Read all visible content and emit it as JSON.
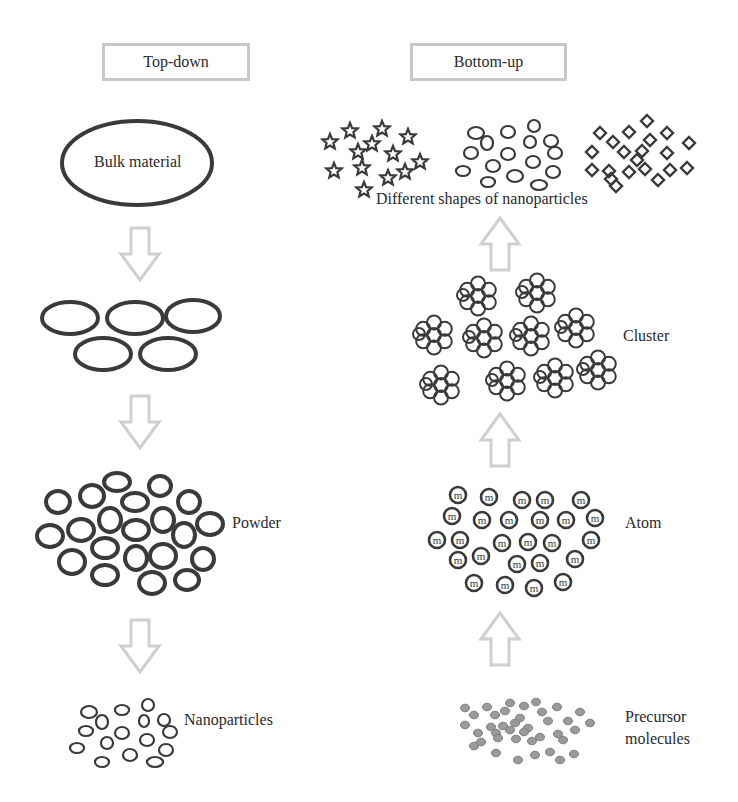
{
  "colors": {
    "outline": "#3a3a3a",
    "arrow": "#cfcfcf",
    "header_border": "#c8c8c8",
    "precursor_fill": "#9a9a9a",
    "precursor_stroke": "#7d7d7d",
    "text": "#2a2a2a"
  },
  "headers": {
    "top_down": "Top-down",
    "bottom_up": "Bottom-up"
  },
  "top_down": {
    "bulk_label": "Bulk material",
    "powder_label": "Powder",
    "nanoparticles_label": "Nanoparticles",
    "bulk": {
      "cx": 137,
      "cy": 163,
      "rx": 75,
      "ry": 42
    },
    "fragments": [
      {
        "cx": 70,
        "cy": 318,
        "rx": 28,
        "ry": 16
      },
      {
        "cx": 135,
        "cy": 318,
        "rx": 28,
        "ry": 16
      },
      {
        "cx": 193,
        "cy": 316,
        "rx": 27,
        "ry": 16
      },
      {
        "cx": 103,
        "cy": 354,
        "rx": 28,
        "ry": 16
      },
      {
        "cx": 168,
        "cy": 354,
        "rx": 28,
        "ry": 16
      }
    ],
    "powder": [
      {
        "cx": 58,
        "cy": 502,
        "rx": 12,
        "ry": 11
      },
      {
        "cx": 92,
        "cy": 496,
        "rx": 12,
        "ry": 11
      },
      {
        "cx": 117,
        "cy": 482,
        "rx": 13,
        "ry": 9
      },
      {
        "cx": 160,
        "cy": 486,
        "rx": 11,
        "ry": 10
      },
      {
        "cx": 135,
        "cy": 502,
        "rx": 13,
        "ry": 9
      },
      {
        "cx": 189,
        "cy": 502,
        "rx": 11,
        "ry": 11
      },
      {
        "cx": 50,
        "cy": 536,
        "rx": 13,
        "ry": 11
      },
      {
        "cx": 81,
        "cy": 530,
        "rx": 13,
        "ry": 11
      },
      {
        "cx": 110,
        "cy": 520,
        "rx": 11,
        "ry": 12
      },
      {
        "cx": 136,
        "cy": 530,
        "rx": 13,
        "ry": 10
      },
      {
        "cx": 163,
        "cy": 520,
        "rx": 11,
        "ry": 12
      },
      {
        "cx": 184,
        "cy": 535,
        "rx": 11,
        "ry": 12
      },
      {
        "cx": 210,
        "cy": 524,
        "rx": 13,
        "ry": 11
      },
      {
        "cx": 105,
        "cy": 548,
        "rx": 13,
        "ry": 10
      },
      {
        "cx": 72,
        "cy": 562,
        "rx": 13,
        "ry": 12
      },
      {
        "cx": 136,
        "cy": 558,
        "rx": 11,
        "ry": 12
      },
      {
        "cx": 163,
        "cy": 556,
        "rx": 13,
        "ry": 12
      },
      {
        "cx": 203,
        "cy": 559,
        "rx": 11,
        "ry": 11
      },
      {
        "cx": 105,
        "cy": 575,
        "rx": 13,
        "ry": 10
      },
      {
        "cx": 152,
        "cy": 583,
        "rx": 13,
        "ry": 11
      },
      {
        "cx": 187,
        "cy": 580,
        "rx": 12,
        "ry": 10
      }
    ],
    "nanoparticles": [
      {
        "cx": 89,
        "cy": 712,
        "rx": 8,
        "ry": 6
      },
      {
        "cx": 102,
        "cy": 722,
        "rx": 6,
        "ry": 7
      },
      {
        "cx": 122,
        "cy": 710,
        "rx": 7,
        "ry": 5
      },
      {
        "cx": 148,
        "cy": 705,
        "rx": 6,
        "ry": 6
      },
      {
        "cx": 144,
        "cy": 721,
        "rx": 5,
        "ry": 6
      },
      {
        "cx": 164,
        "cy": 720,
        "rx": 6,
        "ry": 6
      },
      {
        "cx": 86,
        "cy": 731,
        "rx": 7,
        "ry": 5
      },
      {
        "cx": 122,
        "cy": 733,
        "rx": 7,
        "ry": 6
      },
      {
        "cx": 170,
        "cy": 732,
        "rx": 7,
        "ry": 6
      },
      {
        "cx": 107,
        "cy": 743,
        "rx": 6,
        "ry": 6
      },
      {
        "cx": 147,
        "cy": 740,
        "rx": 7,
        "ry": 6
      },
      {
        "cx": 77,
        "cy": 748,
        "rx": 7,
        "ry": 5
      },
      {
        "cx": 130,
        "cy": 755,
        "rx": 7,
        "ry": 6
      },
      {
        "cx": 166,
        "cy": 750,
        "rx": 7,
        "ry": 6
      },
      {
        "cx": 102,
        "cy": 762,
        "rx": 7,
        "ry": 5
      },
      {
        "cx": 155,
        "cy": 762,
        "rx": 8,
        "ry": 5
      }
    ]
  },
  "bottom_up": {
    "shapes_label": "Different shapes of nanoparticles",
    "cluster_label": "Cluster",
    "atom_label": "Atom",
    "atom_glyph": "m",
    "precursor_label_line1": "Precursor",
    "precursor_label_line2": "molecules",
    "stars": [
      {
        "x": 350,
        "y": 131
      },
      {
        "x": 382,
        "y": 129
      },
      {
        "x": 408,
        "y": 137
      },
      {
        "x": 330,
        "y": 142
      },
      {
        "x": 372,
        "y": 144
      },
      {
        "x": 358,
        "y": 152
      },
      {
        "x": 393,
        "y": 154
      },
      {
        "x": 334,
        "y": 171
      },
      {
        "x": 362,
        "y": 168
      },
      {
        "x": 388,
        "y": 178
      },
      {
        "x": 405,
        "y": 172
      },
      {
        "x": 420,
        "y": 162
      },
      {
        "x": 364,
        "y": 190
      }
    ],
    "ovals": [
      {
        "cx": 476,
        "cy": 133,
        "rx": 8,
        "ry": 6
      },
      {
        "cx": 508,
        "cy": 132,
        "rx": 7,
        "ry": 6
      },
      {
        "cx": 534,
        "cy": 126,
        "rx": 6,
        "ry": 6
      },
      {
        "cx": 487,
        "cy": 143,
        "rx": 6,
        "ry": 7
      },
      {
        "cx": 530,
        "cy": 142,
        "rx": 6,
        "ry": 6
      },
      {
        "cx": 551,
        "cy": 141,
        "rx": 7,
        "ry": 6
      },
      {
        "cx": 471,
        "cy": 153,
        "rx": 7,
        "ry": 6
      },
      {
        "cx": 508,
        "cy": 154,
        "rx": 7,
        "ry": 6
      },
      {
        "cx": 555,
        "cy": 153,
        "rx": 7,
        "ry": 6
      },
      {
        "cx": 493,
        "cy": 166,
        "rx": 7,
        "ry": 6
      },
      {
        "cx": 533,
        "cy": 162,
        "rx": 7,
        "ry": 6
      },
      {
        "cx": 463,
        "cy": 171,
        "rx": 7,
        "ry": 5
      },
      {
        "cx": 515,
        "cy": 176,
        "rx": 8,
        "ry": 6
      },
      {
        "cx": 553,
        "cy": 172,
        "rx": 7,
        "ry": 6
      },
      {
        "cx": 488,
        "cy": 182,
        "rx": 7,
        "ry": 5
      },
      {
        "cx": 539,
        "cy": 185,
        "rx": 8,
        "ry": 5
      }
    ],
    "diamonds": [
      {
        "x": 647,
        "y": 121
      },
      {
        "x": 600,
        "y": 133
      },
      {
        "x": 629,
        "y": 132
      },
      {
        "x": 667,
        "y": 133
      },
      {
        "x": 613,
        "y": 142
      },
      {
        "x": 650,
        "y": 140
      },
      {
        "x": 689,
        "y": 143
      },
      {
        "x": 592,
        "y": 152
      },
      {
        "x": 624,
        "y": 152
      },
      {
        "x": 642,
        "y": 151
      },
      {
        "x": 667,
        "y": 153
      },
      {
        "x": 637,
        "y": 160
      },
      {
        "x": 592,
        "y": 170
      },
      {
        "x": 609,
        "y": 171
      },
      {
        "x": 629,
        "y": 172
      },
      {
        "x": 645,
        "y": 169
      },
      {
        "x": 670,
        "y": 170
      },
      {
        "x": 687,
        "y": 168
      },
      {
        "x": 616,
        "y": 186
      },
      {
        "x": 658,
        "y": 180
      },
      {
        "x": 611,
        "y": 179
      }
    ],
    "clusters": [
      {
        "x": 478,
        "y": 296
      },
      {
        "x": 537,
        "y": 293
      },
      {
        "x": 434,
        "y": 335
      },
      {
        "x": 484,
        "y": 338
      },
      {
        "x": 531,
        "y": 336
      },
      {
        "x": 576,
        "y": 328
      },
      {
        "x": 441,
        "y": 385
      },
      {
        "x": 507,
        "y": 381
      },
      {
        "x": 555,
        "y": 378
      },
      {
        "x": 598,
        "y": 370
      }
    ],
    "atoms": [
      {
        "x": 458,
        "y": 495
      },
      {
        "x": 489,
        "y": 497
      },
      {
        "x": 522,
        "y": 500
      },
      {
        "x": 545,
        "y": 500
      },
      {
        "x": 581,
        "y": 500
      },
      {
        "x": 452,
        "y": 516
      },
      {
        "x": 482,
        "y": 520
      },
      {
        "x": 509,
        "y": 520
      },
      {
        "x": 540,
        "y": 520
      },
      {
        "x": 566,
        "y": 520
      },
      {
        "x": 595,
        "y": 518
      },
      {
        "x": 437,
        "y": 540
      },
      {
        "x": 460,
        "y": 540
      },
      {
        "x": 502,
        "y": 543
      },
      {
        "x": 528,
        "y": 542
      },
      {
        "x": 552,
        "y": 543
      },
      {
        "x": 591,
        "y": 540
      },
      {
        "x": 458,
        "y": 560
      },
      {
        "x": 481,
        "y": 556
      },
      {
        "x": 517,
        "y": 564
      },
      {
        "x": 540,
        "y": 563
      },
      {
        "x": 575,
        "y": 559
      },
      {
        "x": 474,
        "y": 583
      },
      {
        "x": 505,
        "y": 585
      },
      {
        "x": 534,
        "y": 588
      },
      {
        "x": 563,
        "y": 582
      }
    ],
    "precursors": [
      {
        "x": 465,
        "y": 708
      },
      {
        "x": 487,
        "y": 707
      },
      {
        "x": 510,
        "y": 703
      },
      {
        "x": 524,
        "y": 706
      },
      {
        "x": 536,
        "y": 702
      },
      {
        "x": 557,
        "y": 707
      },
      {
        "x": 474,
        "y": 715
      },
      {
        "x": 495,
        "y": 715
      },
      {
        "x": 505,
        "y": 711
      },
      {
        "x": 520,
        "y": 718
      },
      {
        "x": 542,
        "y": 712
      },
      {
        "x": 580,
        "y": 712
      },
      {
        "x": 465,
        "y": 725
      },
      {
        "x": 491,
        "y": 727
      },
      {
        "x": 503,
        "y": 726
      },
      {
        "x": 515,
        "y": 723
      },
      {
        "x": 528,
        "y": 728
      },
      {
        "x": 548,
        "y": 721
      },
      {
        "x": 568,
        "y": 721
      },
      {
        "x": 590,
        "y": 723
      },
      {
        "x": 478,
        "y": 733
      },
      {
        "x": 496,
        "y": 733
      },
      {
        "x": 510,
        "y": 730
      },
      {
        "x": 524,
        "y": 732
      },
      {
        "x": 540,
        "y": 737
      },
      {
        "x": 558,
        "y": 734
      },
      {
        "x": 575,
        "y": 730
      },
      {
        "x": 481,
        "y": 742
      },
      {
        "x": 498,
        "y": 738
      },
      {
        "x": 516,
        "y": 739
      },
      {
        "x": 532,
        "y": 741
      },
      {
        "x": 563,
        "y": 740
      },
      {
        "x": 474,
        "y": 746
      },
      {
        "x": 496,
        "y": 753
      },
      {
        "x": 518,
        "y": 760
      },
      {
        "x": 535,
        "y": 755
      },
      {
        "x": 550,
        "y": 752
      },
      {
        "x": 560,
        "y": 760
      },
      {
        "x": 574,
        "y": 754
      }
    ]
  },
  "arrows": {
    "down": [
      {
        "x": 140,
        "y": 228
      },
      {
        "x": 140,
        "y": 396
      },
      {
        "x": 140,
        "y": 620
      }
    ],
    "up": [
      {
        "x": 500,
        "y": 218
      },
      {
        "x": 500,
        "y": 414
      },
      {
        "x": 500,
        "y": 613
      }
    ]
  },
  "layout": {
    "header_top_down": {
      "left": 102,
      "top": 43,
      "width": 148,
      "height": 38
    },
    "header_bottom_up": {
      "left": 410,
      "top": 43,
      "width": 157,
      "height": 38
    }
  }
}
